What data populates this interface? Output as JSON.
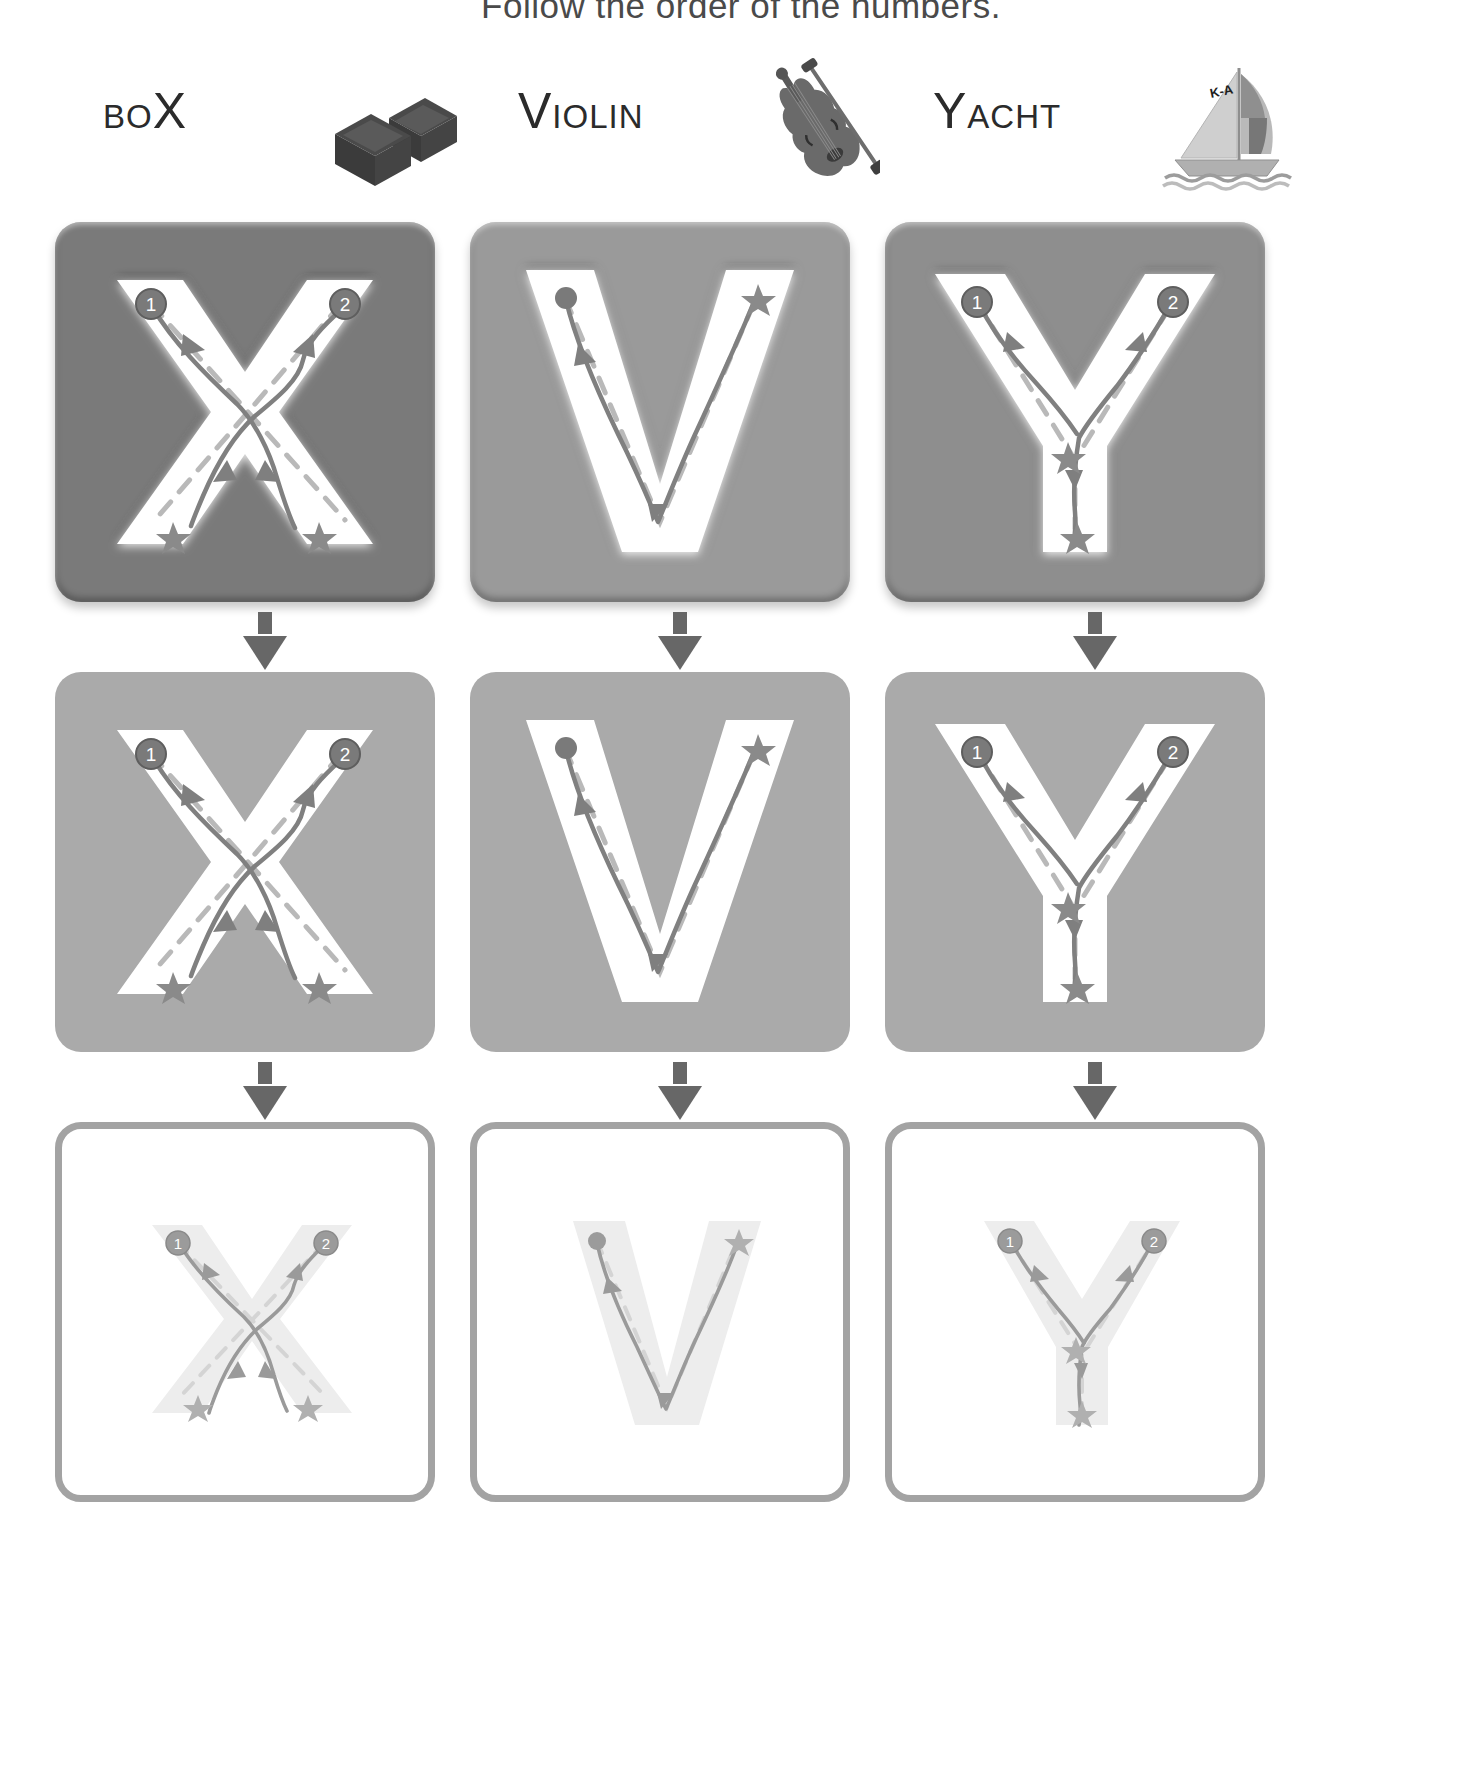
{
  "header": {
    "instruction": "Follow the order of the numbers."
  },
  "colors": {
    "page_background": "#ffffff",
    "header_text": "#4a4a4a",
    "word_text": "#2b2b2b",
    "arrow": "#676767",
    "card_row1_x": "#7a7a7a",
    "card_row1_v": "#9a9a9a",
    "card_row1_y": "#8e8e8e",
    "card_row2": "#aaaaaa",
    "card_row3_border": "#a3a3a3",
    "card_row3_fill": "#ffffff",
    "letter_row1": "#ffffff",
    "letter_row2": "#ffffff",
    "letter_row3": "#e9e9e9",
    "stroke_path": "#7f7f7f",
    "guide_dash": "#b9b9b9",
    "marker_badge": "#7a7a7a",
    "star": "#8a8a8a"
  },
  "columns": [
    {
      "id": "column-box-x",
      "letter": "X",
      "word": {
        "lead": "BO",
        "accent": "X",
        "full": "BOX",
        "lead_case": "small-caps-first"
      },
      "picture": {
        "name": "box-illustration",
        "alt": "two dark cardboard boxes"
      },
      "strokes": [
        {
          "order": "1",
          "marker": "numbered-circle",
          "start": "upper-left",
          "end": "lower-right",
          "end_marker": "star"
        },
        {
          "order": "2",
          "marker": "numbered-circle",
          "start": "upper-right",
          "end": "lower-left",
          "end_marker": "star"
        }
      ],
      "steps": [
        {
          "row": 1,
          "style": "embossed-plaque",
          "background": "#7a7a7a"
        },
        {
          "row": 2,
          "style": "flat-grey",
          "background": "#aaaaaa"
        },
        {
          "row": 3,
          "style": "outline-white",
          "background": "#ffffff"
        }
      ]
    },
    {
      "id": "column-violin-v",
      "letter": "V",
      "word": {
        "lead": "V",
        "accent": "IOLIN",
        "full": "VIOLIN",
        "lead_case": "large-first"
      },
      "picture": {
        "name": "violin-illustration",
        "alt": "violin with bow"
      },
      "strokes": [
        {
          "order": "1",
          "marker": "start-dot",
          "start": "upper-left",
          "end": "upper-right",
          "end_marker": "star"
        }
      ],
      "steps": [
        {
          "row": 1,
          "style": "embossed-plaque",
          "background": "#9a9a9a"
        },
        {
          "row": 2,
          "style": "flat-grey",
          "background": "#aaaaaa"
        },
        {
          "row": 3,
          "style": "outline-white",
          "background": "#ffffff"
        }
      ]
    },
    {
      "id": "column-yacht-y",
      "letter": "Y",
      "word": {
        "lead": "Y",
        "accent": "ACHT",
        "full": "YACHT",
        "lead_case": "large-first"
      },
      "picture": {
        "name": "yacht-illustration",
        "alt": "sailboat with K-A on sail",
        "sail_label": "K-A"
      },
      "strokes": [
        {
          "order": "1",
          "marker": "numbered-circle",
          "start": "upper-left",
          "end": "center-junction",
          "end_marker": "star"
        },
        {
          "order": "2",
          "marker": "numbered-circle",
          "start": "upper-right",
          "end": "bottom",
          "end_marker": "star"
        }
      ],
      "steps": [
        {
          "row": 1,
          "style": "embossed-plaque",
          "background": "#8e8e8e"
        },
        {
          "row": 2,
          "style": "flat-grey",
          "background": "#aaaaaa"
        },
        {
          "row": 3,
          "style": "outline-white",
          "background": "#ffffff"
        }
      ]
    }
  ],
  "rows": [
    {
      "index": 1,
      "label": "embossed-plaque-row",
      "top": 222
    },
    {
      "index": 2,
      "label": "flat-grey-row",
      "top": 672
    },
    {
      "index": 3,
      "label": "outline-white-row",
      "top": 1122
    }
  ],
  "connectors": {
    "name": "down-arrow",
    "count_per_column": 2,
    "glyph": "↓"
  }
}
